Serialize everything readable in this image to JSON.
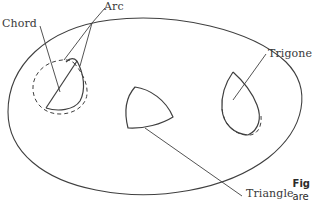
{
  "figure": {
    "background_color": "#ffffff",
    "stroke_color": "#3f3f3f",
    "text_color": "#3a3a3a",
    "labels": {
      "chord": "Chord",
      "arc": "Arc",
      "trigone": "Trigone",
      "triangle": "Triangle"
    },
    "caption": {
      "line1": "Fig",
      "line2": "are"
    },
    "label_positions": {
      "chord": {
        "x": 2,
        "y": 18
      },
      "arc": {
        "x": 104,
        "y": 1
      },
      "trigone": {
        "x": 268,
        "y": 48
      },
      "triangle": {
        "x": 246,
        "y": 188
      }
    }
  },
  "shapes": {
    "boundary": {
      "name": "outer-ellipse",
      "style": "solid",
      "description": "Large tilted ellipse enclosing all inner regions"
    },
    "left_region": {
      "name": "chord-arc-region",
      "outline_style": "dashed",
      "inner_style": "solid",
      "description": "Teardrop outline with a solid chord and arc marked inside"
    },
    "middle_region": {
      "name": "triangle-region",
      "outline_style": "solid",
      "description": "Curved-sided triangle"
    },
    "right_region": {
      "name": "trigone-region",
      "outline_style": "solid-top-dashed-bottom",
      "description": "Teardrop with solid upper sides and dashed lower arc"
    }
  }
}
